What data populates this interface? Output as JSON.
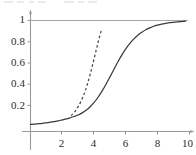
{
  "figure": {
    "title": "",
    "background_color": "#ffffff",
    "axis_color": "#9a9a9a",
    "curve_color": "#3a3a3a",
    "dashed_color": "#4a4a4a",
    "reference_line_color": "#a5a5a5",
    "label_color": "#2b2b2b"
  },
  "axes": {
    "x_ticks": [
      {
        "value": 2,
        "label": "2"
      },
      {
        "value": 4,
        "label": "4"
      },
      {
        "value": 6,
        "label": "6"
      },
      {
        "value": 8,
        "label": "8"
      },
      {
        "value": 10,
        "label": "10"
      }
    ],
    "y_ticks": [
      {
        "value": 0.2,
        "label": "0.2"
      },
      {
        "value": 0.4,
        "label": "0.4"
      },
      {
        "value": 0.6,
        "label": "0.6"
      },
      {
        "value": 0.8,
        "label": "0.8"
      },
      {
        "value": 1.0,
        "label": "1"
      }
    ]
  },
  "chart_data": {
    "type": "line",
    "title": "",
    "xlabel": "",
    "ylabel": "",
    "xlim": [
      0,
      10
    ],
    "ylim": [
      0,
      1.04
    ],
    "grid": false,
    "legend": "none",
    "annotations": [
      {
        "kind": "reference-line",
        "orientation": "horizontal",
        "y": 1.0,
        "style": "solid",
        "color": "#a5a5a5"
      }
    ],
    "series": [
      {
        "name": "logistic",
        "style": "solid",
        "color": "#3a3a3a",
        "x": [
          0.0,
          0.25,
          0.5,
          0.75,
          1.0,
          1.25,
          1.5,
          1.75,
          2.0,
          2.25,
          2.5,
          2.75,
          3.0,
          3.25,
          3.5,
          3.75,
          4.0,
          4.25,
          4.5,
          4.75,
          5.0,
          5.25,
          5.5,
          5.75,
          6.0,
          6.25,
          6.5,
          6.75,
          7.0,
          7.25,
          7.5,
          7.75,
          8.0,
          8.25,
          8.5,
          8.75,
          9.0,
          9.25,
          9.5,
          9.75
        ],
        "y": [
          0.022,
          0.025,
          0.029,
          0.033,
          0.038,
          0.043,
          0.049,
          0.056,
          0.065,
          0.074,
          0.085,
          0.097,
          0.111,
          0.131,
          0.156,
          0.189,
          0.229,
          0.278,
          0.335,
          0.4,
          0.47,
          0.542,
          0.612,
          0.677,
          0.735,
          0.785,
          0.827,
          0.862,
          0.89,
          0.913,
          0.931,
          0.946,
          0.957,
          0.966,
          0.973,
          0.979,
          0.983,
          0.987,
          0.99,
          0.993
        ]
      },
      {
        "name": "exponential-approximation",
        "style": "dashed",
        "color": "#4a4a4a",
        "x": [
          2.55,
          2.7,
          2.85,
          3.0,
          3.15,
          3.3,
          3.45,
          3.6,
          3.75,
          3.9,
          4.05,
          4.2,
          4.35,
          4.45
        ],
        "y": [
          0.105,
          0.127,
          0.155,
          0.19,
          0.232,
          0.282,
          0.342,
          0.412,
          0.492,
          0.58,
          0.672,
          0.764,
          0.852,
          0.905
        ]
      }
    ]
  }
}
